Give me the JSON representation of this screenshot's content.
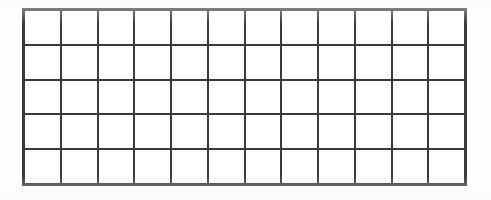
{
  "figure": {
    "type": "rectangular-grid",
    "columns": 12,
    "rows": 5,
    "cells_total": 60,
    "line_color": "#3a3a3a",
    "cell_fill_color": "#ffffff",
    "background_color": "#fefefe",
    "line_width_px": 2,
    "outer_line_width_px": 3,
    "bounds": {
      "left_px": 22,
      "top_px": 8,
      "right_px": 467,
      "bottom_px": 186,
      "width_px": 445,
      "height_px": 178
    },
    "cell_size": {
      "width_px": 37.1,
      "height_px": 35.6
    },
    "labels": [],
    "annotations": [],
    "text": ""
  },
  "canvas": {
    "width_px": 491,
    "height_px": 200
  }
}
